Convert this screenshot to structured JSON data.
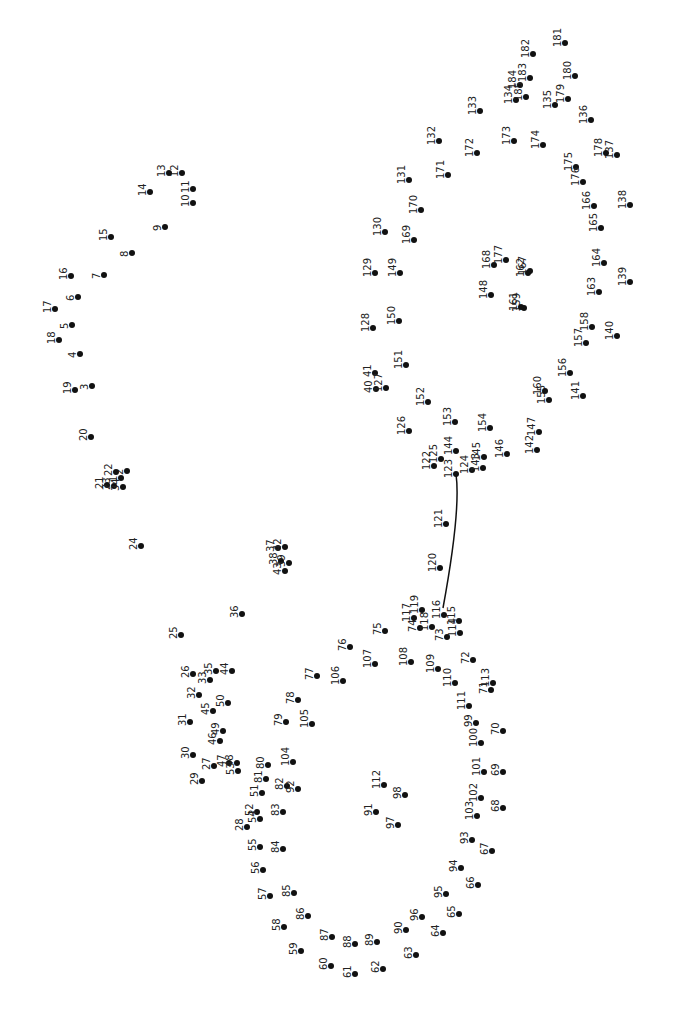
{
  "puzzle": {
    "type": "connect-the-dots",
    "orientation": "rotated-90",
    "line_color": "#111111",
    "dot_color": "#111111",
    "drawn_segment": [
      [
        456,
        474
      ],
      [
        461,
        510
      ],
      [
        443,
        608
      ]
    ],
    "dots": [
      {
        "n": 1,
        "x": 121,
        "y": 478
      },
      {
        "n": 2,
        "x": 127,
        "y": 471
      },
      {
        "n": 3,
        "x": 92,
        "y": 386
      },
      {
        "n": 4,
        "x": 80,
        "y": 354
      },
      {
        "n": 5,
        "x": 72,
        "y": 325
      },
      {
        "n": 6,
        "x": 78,
        "y": 297
      },
      {
        "n": 7,
        "x": 104,
        "y": 275
      },
      {
        "n": 8,
        "x": 132,
        "y": 253
      },
      {
        "n": 9,
        "x": 165,
        "y": 227
      },
      {
        "n": 10,
        "x": 193,
        "y": 203
      },
      {
        "n": 11,
        "x": 193,
        "y": 189
      },
      {
        "n": 12,
        "x": 182,
        "y": 173
      },
      {
        "n": 13,
        "x": 169,
        "y": 173
      },
      {
        "n": 14,
        "x": 150,
        "y": 192
      },
      {
        "n": 15,
        "x": 111,
        "y": 237
      },
      {
        "n": 16,
        "x": 71,
        "y": 276
      },
      {
        "n": 17,
        "x": 55,
        "y": 309
      },
      {
        "n": 18,
        "x": 59,
        "y": 340
      },
      {
        "n": 19,
        "x": 75,
        "y": 390
      },
      {
        "n": 20,
        "x": 91,
        "y": 437
      },
      {
        "n": 21,
        "x": 107,
        "y": 485
      },
      {
        "n": 22,
        "x": 116,
        "y": 472
      },
      {
        "n": 23,
        "x": 114,
        "y": 486
      },
      {
        "n": 24,
        "x": 141,
        "y": 546
      },
      {
        "n": 25,
        "x": 181,
        "y": 635
      },
      {
        "n": 26,
        "x": 193,
        "y": 674
      },
      {
        "n": 27,
        "x": 214,
        "y": 766
      },
      {
        "n": 28,
        "x": 247,
        "y": 827
      },
      {
        "n": 29,
        "x": 202,
        "y": 781
      },
      {
        "n": 30,
        "x": 193,
        "y": 755
      },
      {
        "n": 31,
        "x": 190,
        "y": 722
      },
      {
        "n": 32,
        "x": 199,
        "y": 695
      },
      {
        "n": 33,
        "x": 210,
        "y": 680
      },
      {
        "n": 34,
        "x": 123,
        "y": 487
      },
      {
        "n": 35,
        "x": 216,
        "y": 671
      },
      {
        "n": 36,
        "x": 242,
        "y": 614
      },
      {
        "n": 37,
        "x": 278,
        "y": 548
      },
      {
        "n": 38,
        "x": 281,
        "y": 561
      },
      {
        "n": 39,
        "x": 289,
        "y": 563
      },
      {
        "n": 40,
        "x": 376,
        "y": 389
      },
      {
        "n": 41,
        "x": 375,
        "y": 373
      },
      {
        "n": 42,
        "x": 285,
        "y": 547
      },
      {
        "n": 43,
        "x": 285,
        "y": 571
      },
      {
        "n": 44,
        "x": 232,
        "y": 671
      },
      {
        "n": 45,
        "x": 213,
        "y": 711
      },
      {
        "n": 46,
        "x": 220,
        "y": 741
      },
      {
        "n": 47,
        "x": 229,
        "y": 763
      },
      {
        "n": 48,
        "x": 237,
        "y": 763
      },
      {
        "n": 49,
        "x": 223,
        "y": 731
      },
      {
        "n": 50,
        "x": 228,
        "y": 703
      },
      {
        "n": 51,
        "x": 262,
        "y": 793
      },
      {
        "n": 52,
        "x": 257,
        "y": 812
      },
      {
        "n": 53,
        "x": 238,
        "y": 771
      },
      {
        "n": 54,
        "x": 260,
        "y": 819
      },
      {
        "n": 55,
        "x": 260,
        "y": 847
      },
      {
        "n": 56,
        "x": 263,
        "y": 870
      },
      {
        "n": 57,
        "x": 270,
        "y": 896
      },
      {
        "n": 58,
        "x": 284,
        "y": 927
      },
      {
        "n": 59,
        "x": 301,
        "y": 951
      },
      {
        "n": 60,
        "x": 331,
        "y": 966
      },
      {
        "n": 61,
        "x": 355,
        "y": 974
      },
      {
        "n": 62,
        "x": 383,
        "y": 969
      },
      {
        "n": 63,
        "x": 416,
        "y": 955
      },
      {
        "n": 64,
        "x": 443,
        "y": 933
      },
      {
        "n": 65,
        "x": 459,
        "y": 914
      },
      {
        "n": 66,
        "x": 478,
        "y": 885
      },
      {
        "n": 67,
        "x": 492,
        "y": 851
      },
      {
        "n": 68,
        "x": 503,
        "y": 808
      },
      {
        "n": 69,
        "x": 503,
        "y": 772
      },
      {
        "n": 70,
        "x": 503,
        "y": 731
      },
      {
        "n": 71,
        "x": 491,
        "y": 690
      },
      {
        "n": 72,
        "x": 473,
        "y": 660
      },
      {
        "n": 73,
        "x": 447,
        "y": 637
      },
      {
        "n": 74,
        "x": 420,
        "y": 628
      },
      {
        "n": 75,
        "x": 385,
        "y": 631
      },
      {
        "n": 76,
        "x": 350,
        "y": 647
      },
      {
        "n": 77,
        "x": 317,
        "y": 676
      },
      {
        "n": 78,
        "x": 298,
        "y": 700
      },
      {
        "n": 79,
        "x": 286,
        "y": 722
      },
      {
        "n": 80,
        "x": 268,
        "y": 765
      },
      {
        "n": 81,
        "x": 266,
        "y": 779
      },
      {
        "n": 82,
        "x": 287,
        "y": 786
      },
      {
        "n": 83,
        "x": 283,
        "y": 812
      },
      {
        "n": 84,
        "x": 283,
        "y": 849
      },
      {
        "n": 85,
        "x": 294,
        "y": 893
      },
      {
        "n": 86,
        "x": 308,
        "y": 916
      },
      {
        "n": 87,
        "x": 332,
        "y": 937
      },
      {
        "n": 88,
        "x": 355,
        "y": 944
      },
      {
        "n": 89,
        "x": 377,
        "y": 942
      },
      {
        "n": 90,
        "x": 406,
        "y": 930
      },
      {
        "n": 91,
        "x": 376,
        "y": 812
      },
      {
        "n": 92,
        "x": 298,
        "y": 789
      },
      {
        "n": 93,
        "x": 472,
        "y": 840
      },
      {
        "n": 94,
        "x": 461,
        "y": 868
      },
      {
        "n": 95,
        "x": 446,
        "y": 894
      },
      {
        "n": 96,
        "x": 422,
        "y": 917
      },
      {
        "n": 97,
        "x": 398,
        "y": 825
      },
      {
        "n": 98,
        "x": 405,
        "y": 795
      },
      {
        "n": 99,
        "x": 476,
        "y": 723
      },
      {
        "n": 100,
        "x": 481,
        "y": 743
      },
      {
        "n": 101,
        "x": 484,
        "y": 772
      },
      {
        "n": 102,
        "x": 481,
        "y": 798
      },
      {
        "n": 103,
        "x": 477,
        "y": 816
      },
      {
        "n": 104,
        "x": 293,
        "y": 762
      },
      {
        "n": 105,
        "x": 312,
        "y": 724
      },
      {
        "n": 106,
        "x": 343,
        "y": 681
      },
      {
        "n": 107,
        "x": 375,
        "y": 664
      },
      {
        "n": 108,
        "x": 411,
        "y": 662
      },
      {
        "n": 109,
        "x": 438,
        "y": 669
      },
      {
        "n": 110,
        "x": 455,
        "y": 683
      },
      {
        "n": 111,
        "x": 469,
        "y": 706
      },
      {
        "n": 112,
        "x": 384,
        "y": 785
      },
      {
        "n": 113,
        "x": 493,
        "y": 683
      },
      {
        "n": 114,
        "x": 460,
        "y": 633
      },
      {
        "n": 115,
        "x": 459,
        "y": 621
      },
      {
        "n": 116,
        "x": 444,
        "y": 615
      },
      {
        "n": 117,
        "x": 414,
        "y": 618
      },
      {
        "n": 118,
        "x": 432,
        "y": 627
      },
      {
        "n": 119,
        "x": 422,
        "y": 610
      },
      {
        "n": 120,
        "x": 440,
        "y": 568
      },
      {
        "n": 121,
        "x": 446,
        "y": 524
      },
      {
        "n": 122,
        "x": 434,
        "y": 466
      },
      {
        "n": 123,
        "x": 456,
        "y": 474
      },
      {
        "n": 124,
        "x": 472,
        "y": 470
      },
      {
        "n": 125,
        "x": 441,
        "y": 459
      },
      {
        "n": 126,
        "x": 409,
        "y": 431
      },
      {
        "n": 127,
        "x": 386,
        "y": 388
      },
      {
        "n": 128,
        "x": 373,
        "y": 328
      },
      {
        "n": 129,
        "x": 375,
        "y": 273
      },
      {
        "n": 130,
        "x": 385,
        "y": 232
      },
      {
        "n": 131,
        "x": 409,
        "y": 180
      },
      {
        "n": 132,
        "x": 439,
        "y": 141
      },
      {
        "n": 133,
        "x": 480,
        "y": 111
      },
      {
        "n": 134,
        "x": 516,
        "y": 100
      },
      {
        "n": 135,
        "x": 555,
        "y": 105
      },
      {
        "n": 136,
        "x": 591,
        "y": 120
      },
      {
        "n": 137,
        "x": 617,
        "y": 155
      },
      {
        "n": 138,
        "x": 630,
        "y": 205
      },
      {
        "n": 139,
        "x": 630,
        "y": 282
      },
      {
        "n": 140,
        "x": 617,
        "y": 336
      },
      {
        "n": 141,
        "x": 583,
        "y": 396
      },
      {
        "n": 142,
        "x": 537,
        "y": 450
      },
      {
        "n": 143,
        "x": 483,
        "y": 468
      },
      {
        "n": 144,
        "x": 456,
        "y": 451
      },
      {
        "n": 145,
        "x": 484,
        "y": 457
      },
      {
        "n": 146,
        "x": 507,
        "y": 454
      },
      {
        "n": 147,
        "x": 539,
        "y": 432
      },
      {
        "n": 148,
        "x": 491,
        "y": 295
      },
      {
        "n": 149,
        "x": 400,
        "y": 273
      },
      {
        "n": 150,
        "x": 399,
        "y": 321
      },
      {
        "n": 151,
        "x": 406,
        "y": 365
      },
      {
        "n": 152,
        "x": 428,
        "y": 402
      },
      {
        "n": 153,
        "x": 455,
        "y": 422
      },
      {
        "n": 154,
        "x": 490,
        "y": 428
      },
      {
        "n": 155,
        "x": 549,
        "y": 400
      },
      {
        "n": 156,
        "x": 570,
        "y": 373
      },
      {
        "n": 157,
        "x": 586,
        "y": 343
      },
      {
        "n": 158,
        "x": 592,
        "y": 327
      },
      {
        "n": 159,
        "x": 524,
        "y": 308
      },
      {
        "n": 160,
        "x": 545,
        "y": 391
      },
      {
        "n": 161,
        "x": 521,
        "y": 307
      },
      {
        "n": 162,
        "x": 528,
        "y": 273
      },
      {
        "n": 163,
        "x": 599,
        "y": 292
      },
      {
        "n": 164,
        "x": 604,
        "y": 263
      },
      {
        "n": 165,
        "x": 601,
        "y": 228
      },
      {
        "n": 166,
        "x": 594,
        "y": 206
      },
      {
        "n": 167,
        "x": 530,
        "y": 271
      },
      {
        "n": 168,
        "x": 494,
        "y": 265
      },
      {
        "n": 169,
        "x": 414,
        "y": 240
      },
      {
        "n": 170,
        "x": 421,
        "y": 210
      },
      {
        "n": 171,
        "x": 448,
        "y": 175
      },
      {
        "n": 172,
        "x": 477,
        "y": 153
      },
      {
        "n": 173,
        "x": 514,
        "y": 141
      },
      {
        "n": 174,
        "x": 543,
        "y": 145
      },
      {
        "n": 175,
        "x": 576,
        "y": 167
      },
      {
        "n": 176,
        "x": 583,
        "y": 182
      },
      {
        "n": 177,
        "x": 506,
        "y": 260
      },
      {
        "n": 178,
        "x": 606,
        "y": 153
      },
      {
        "n": 179,
        "x": 568,
        "y": 99
      },
      {
        "n": 180,
        "x": 575,
        "y": 76
      },
      {
        "n": 181,
        "x": 565,
        "y": 43
      },
      {
        "n": 182,
        "x": 533,
        "y": 54
      },
      {
        "n": 183,
        "x": 530,
        "y": 78
      },
      {
        "n": 184,
        "x": 520,
        "y": 85
      },
      {
        "n": 185,
        "x": 526,
        "y": 97
      }
    ]
  }
}
